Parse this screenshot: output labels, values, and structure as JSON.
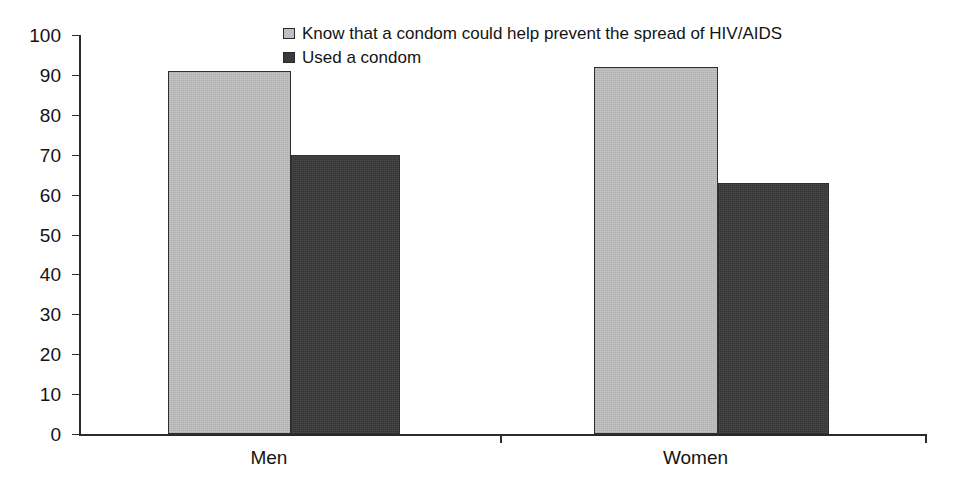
{
  "chart_data": {
    "type": "bar",
    "title": "",
    "subtitle": "",
    "xlabel": "",
    "ylabel": "",
    "categories": [
      "Men",
      "Women"
    ],
    "series": [
      {
        "name": "Know that a condom could help prevent the spread of HIV/AIDS",
        "color": "#bfbfbf",
        "values": [
          91,
          92
        ]
      },
      {
        "name": "Used a condom",
        "color": "#3a3a3a",
        "values": [
          70,
          63
        ]
      }
    ],
    "ylim": [
      0,
      100
    ],
    "ytick_step": 10,
    "ytick_labels": [
      "100",
      "90",
      "80",
      "70",
      "60",
      "50",
      "40",
      "30",
      "20",
      "10",
      "0"
    ],
    "grid": false,
    "legend_position": "top-center"
  },
  "legend": {
    "items": [
      {
        "label": "Know that a condom could help prevent the spread of HIV/AIDS",
        "swatch": "series-light"
      },
      {
        "label": "Used a condom",
        "swatch": "series-dark"
      }
    ]
  },
  "axis": {
    "y_ticks": [
      {
        "label": "100",
        "value": 100
      },
      {
        "label": "90",
        "value": 90
      },
      {
        "label": "80",
        "value": 80
      },
      {
        "label": "70",
        "value": 70
      },
      {
        "label": "60",
        "value": 60
      },
      {
        "label": "50",
        "value": 50
      },
      {
        "label": "40",
        "value": 40
      },
      {
        "label": "30",
        "value": 30
      },
      {
        "label": "20",
        "value": 20
      },
      {
        "label": "10",
        "value": 10
      },
      {
        "label": "0",
        "value": 0
      }
    ],
    "x_categories": [
      {
        "label": "Men",
        "center_pct": 22.4
      },
      {
        "label": "Women",
        "center_pct": 72.7
      }
    ]
  },
  "bars": [
    {
      "group": "Men",
      "series": "series-light",
      "value": 91,
      "left_pct": 10.5,
      "width_pct": 14.5
    },
    {
      "group": "Men",
      "series": "series-dark",
      "value": 70,
      "left_pct": 25.0,
      "width_pct": 12.9
    },
    {
      "group": "Women",
      "series": "series-light",
      "value": 92,
      "left_pct": 60.7,
      "width_pct": 14.6
    },
    {
      "group": "Women",
      "series": "series-dark",
      "value": 63,
      "left_pct": 75.3,
      "width_pct": 13.1
    }
  ]
}
